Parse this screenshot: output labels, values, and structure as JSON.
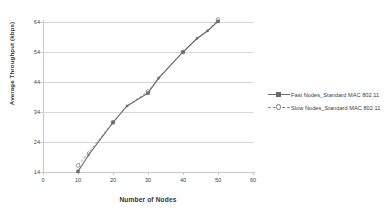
{
  "chart_data": {
    "type": "line",
    "title": "",
    "xlabel": "Number of Nodes",
    "ylabel": "Average Throughput (kbps)",
    "xlim": [
      0,
      60
    ],
    "ylim": [
      14,
      64
    ],
    "xticks": [
      0,
      10,
      20,
      30,
      40,
      50,
      60
    ],
    "yticks": [
      14,
      24,
      34,
      44,
      54,
      64
    ],
    "grid": "horizontal",
    "legend_position": "right",
    "series": [
      {
        "name": "Fast Nodes_Standard MAC 802.11",
        "marker": "square",
        "linestyle": "solid",
        "color": "#6a6a6a",
        "x": [
          10,
          13,
          20,
          24,
          30,
          33,
          40,
          44,
          47,
          50
        ],
        "values": [
          14.2,
          19.6,
          30.5,
          36.0,
          40.3,
          45.2,
          54.0,
          58.5,
          61.0,
          64.2
        ]
      },
      {
        "name": "Slow Nodes_Standard MAC 802.11",
        "marker": "circle",
        "linestyle": "dashed",
        "color": "#8a8a8a",
        "x": [
          10,
          13,
          20,
          24,
          30,
          33,
          40,
          44,
          47,
          50
        ],
        "values": [
          16.2,
          20.4,
          30.6,
          36.0,
          40.8,
          45.4,
          54.0,
          58.6,
          61.1,
          64.8
        ]
      }
    ]
  },
  "axis": {
    "y_tick_labels": [
      "14",
      "24",
      "34",
      "44",
      "54",
      "64"
    ],
    "x_tick_labels": [
      "0",
      "10",
      "20",
      "30",
      "40",
      "50",
      "60"
    ],
    "x_title": "Number of Nodes",
    "y_title": "Average Throughput (kbps)"
  },
  "legend": {
    "entries": [
      {
        "label": "Fast Nodes_Standard MAC 802.11"
      },
      {
        "label": "Slow Nodes_Standard MAC 802.11"
      }
    ]
  }
}
